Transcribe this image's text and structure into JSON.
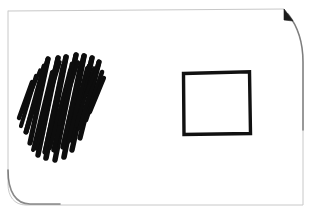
{
  "scene": {
    "title": "Hand-drawn sketch on white paper",
    "background_color": "#ffffff",
    "ink_color": "#0d0d0d",
    "paper_edge_color": "#c8c8c8",
    "width": 312,
    "height": 217
  },
  "paper": {
    "label": "paper-sheet",
    "description": "White paper sheet with faint scanned border, rounded bottom-left corner, curved right edge and a small folded notch at the top-right",
    "edge_path": "M 9 11 L 284 9 L 288 14 C 299 28 303 44 303 62 L 303 205 L 26 205 C 14 205 8 196 8 184 L 8 11 Z",
    "notch": {
      "label": "corner-fold-notch",
      "path": "M 284 9 L 293 21 L 284 20 Z"
    }
  },
  "shapes": [
    {
      "id": "scribble",
      "label": "scribble-mark",
      "type": "scribble",
      "description": "Dense diagonal zigzag scribble, heavily scratched out region",
      "bounds": {
        "x": 17,
        "y": 54,
        "width": 89,
        "height": 107
      },
      "stroke_color": "#0d0d0d",
      "stroke_width": 5
    },
    {
      "id": "square",
      "label": "square-outline",
      "type": "square",
      "description": "Hand-drawn open square outline with slightly irregular edges",
      "bounds": {
        "x": 182,
        "y": 71,
        "width": 68,
        "height": 64
      },
      "stroke_color": "#111111",
      "stroke_width": 3.4,
      "fill": "none",
      "path": "M 183.5 73.5 L 249.5 71.8 L 250.5 133.5 L 184.0 134.5 Z"
    }
  ],
  "scribble_strokes": [
    {
      "d": "M 30 143 L 48 59",
      "w": 5.2
    },
    {
      "d": "M 48 59 L 26 132",
      "w": 5.0
    },
    {
      "d": "M 26 132 L 44 66",
      "w": 4.8
    },
    {
      "d": "M 38 155 L 58 58",
      "w": 5.4
    },
    {
      "d": "M 58 58 L 36 148",
      "w": 5.0
    },
    {
      "d": "M 36 148 L 55 69",
      "w": 4.6
    },
    {
      "d": "M 46 158 L 66 57",
      "w": 5.6
    },
    {
      "d": "M 66 57 L 45 152",
      "w": 5.1
    },
    {
      "d": "M 45 152 L 63 66",
      "w": 4.7
    },
    {
      "d": "M 55 160 L 76 55",
      "w": 5.4
    },
    {
      "d": "M 76 55 L 54 150",
      "w": 5.0
    },
    {
      "d": "M 54 150 L 72 64",
      "w": 4.8
    },
    {
      "d": "M 64 157 L 84 56",
      "w": 5.6
    },
    {
      "d": "M 84 56 L 63 147",
      "w": 5.2
    },
    {
      "d": "M 63 147 L 81 63",
      "w": 4.6
    },
    {
      "d": "M 72 150 L 92 58",
      "w": 5.4
    },
    {
      "d": "M 92 58 L 71 140",
      "w": 5.0
    },
    {
      "d": "M 71 140 L 89 66",
      "w": 4.7
    },
    {
      "d": "M 80 138 L 99 62",
      "w": 5.2
    },
    {
      "d": "M 99 62 L 80 128",
      "w": 4.8
    },
    {
      "d": "M 19 118 L 32 82",
      "w": 4.4
    },
    {
      "d": "M 21 126 L 36 76",
      "w": 4.2
    },
    {
      "d": "M 86 120 L 102 72",
      "w": 4.6
    },
    {
      "d": "M 90 112 L 104 78",
      "w": 4.2
    },
    {
      "d": "M 33 150 L 52 72",
      "w": 4.0
    },
    {
      "d": "M 50 148 L 70 70",
      "w": 4.0
    },
    {
      "d": "M 68 142 L 87 68",
      "w": 4.0
    },
    {
      "d": "M 42 120 L 60 62",
      "w": 3.6
    },
    {
      "d": "M 59 124 L 78 62",
      "w": 3.6
    },
    {
      "d": "M 76 126 L 94 68",
      "w": 3.6
    },
    {
      "d": "M 24 110 L 40 70",
      "w": 3.4
    },
    {
      "d": "M 85 96 L 98 66",
      "w": 3.4
    }
  ]
}
